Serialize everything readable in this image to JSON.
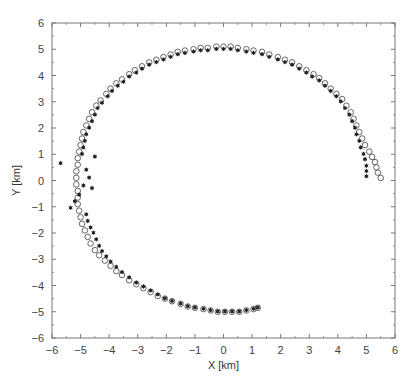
{
  "chart_data": {
    "type": "scatter",
    "title": "",
    "xlabel": "X [km]",
    "ylabel": "Y [km]",
    "xlim": [
      -6,
      6
    ],
    "ylim": [
      -6,
      6
    ],
    "xticks": [
      -6,
      -5,
      -4,
      -3,
      -2,
      -1,
      0,
      1,
      2,
      3,
      4,
      5,
      6
    ],
    "yticks": [
      -6,
      -5,
      -4,
      -3,
      -2,
      -1,
      0,
      1,
      2,
      3,
      4,
      5,
      6
    ],
    "grid": false,
    "legend": null,
    "series": [
      {
        "name": "open-circles",
        "marker": "circle-open",
        "color": "#555555",
        "points": [
          [
            5.5,
            0.1
          ],
          [
            5.4,
            0.3
          ],
          [
            5.35,
            0.5
          ],
          [
            5.3,
            0.7
          ],
          [
            5.2,
            0.9
          ],
          [
            5.1,
            1.1
          ],
          [
            4.95,
            1.35
          ],
          [
            4.85,
            1.6
          ],
          [
            4.75,
            1.85
          ],
          [
            4.65,
            2.1
          ],
          [
            4.55,
            2.35
          ],
          [
            4.45,
            2.6
          ],
          [
            4.3,
            2.85
          ],
          [
            4.15,
            3.1
          ],
          [
            3.95,
            3.3
          ],
          [
            3.75,
            3.5
          ],
          [
            3.55,
            3.7
          ],
          [
            3.35,
            3.9
          ],
          [
            3.15,
            4.05
          ],
          [
            2.9,
            4.2
          ],
          [
            2.65,
            4.35
          ],
          [
            2.4,
            4.5
          ],
          [
            2.15,
            4.6
          ],
          [
            1.9,
            4.7
          ],
          [
            1.6,
            4.8
          ],
          [
            1.35,
            4.9
          ],
          [
            1.05,
            4.95
          ],
          [
            0.8,
            5.0
          ],
          [
            0.5,
            5.05
          ],
          [
            0.25,
            5.1
          ],
          [
            0.0,
            5.1
          ],
          [
            -0.25,
            5.1
          ],
          [
            -0.55,
            5.05
          ],
          [
            -0.8,
            5.05
          ],
          [
            -1.05,
            5.0
          ],
          [
            -1.35,
            4.95
          ],
          [
            -1.6,
            4.9
          ],
          [
            -1.85,
            4.8
          ],
          [
            -2.1,
            4.7
          ],
          [
            -2.35,
            4.6
          ],
          [
            -2.6,
            4.5
          ],
          [
            -2.85,
            4.35
          ],
          [
            -3.1,
            4.2
          ],
          [
            -3.3,
            4.05
          ],
          [
            -3.55,
            3.85
          ],
          [
            -3.75,
            3.7
          ],
          [
            -3.95,
            3.5
          ],
          [
            -4.1,
            3.3
          ],
          [
            -4.3,
            3.05
          ],
          [
            -4.45,
            2.85
          ],
          [
            -4.6,
            2.6
          ],
          [
            -4.7,
            2.35
          ],
          [
            -4.8,
            2.1
          ],
          [
            -4.9,
            1.85
          ],
          [
            -4.95,
            1.6
          ],
          [
            -5.0,
            1.35
          ],
          [
            -5.05,
            1.1
          ],
          [
            -5.1,
            0.85
          ],
          [
            -5.1,
            0.6
          ],
          [
            -5.15,
            0.35
          ],
          [
            -5.15,
            0.1
          ],
          [
            -5.15,
            -0.15
          ],
          [
            -5.1,
            -0.4
          ],
          [
            -5.1,
            -0.65
          ],
          [
            -5.1,
            -0.9
          ],
          [
            -5.05,
            -1.15
          ],
          [
            -5.0,
            -1.4
          ],
          [
            -4.95,
            -1.65
          ],
          [
            -4.85,
            -1.9
          ],
          [
            -4.75,
            -2.15
          ],
          [
            -4.65,
            -2.4
          ],
          [
            -4.5,
            -2.65
          ],
          [
            -4.35,
            -2.85
          ],
          [
            -4.15,
            -3.05
          ],
          [
            -3.95,
            -3.25
          ],
          [
            -3.75,
            -3.45
          ],
          [
            -3.55,
            -3.6
          ],
          [
            -3.3,
            -3.8
          ],
          [
            -3.05,
            -3.95
          ],
          [
            -2.8,
            -4.1
          ],
          [
            -2.55,
            -4.25
          ],
          [
            -2.3,
            -4.4
          ],
          [
            -2.05,
            -4.5
          ],
          [
            -1.8,
            -4.6
          ],
          [
            -1.5,
            -4.7
          ],
          [
            -1.25,
            -4.8
          ],
          [
            -1.0,
            -4.85
          ],
          [
            -0.7,
            -4.9
          ],
          [
            -0.45,
            -4.95
          ],
          [
            -0.2,
            -5.0
          ],
          [
            0.05,
            -5.0
          ],
          [
            0.3,
            -5.0
          ],
          [
            0.55,
            -5.0
          ],
          [
            0.8,
            -4.95
          ],
          [
            1.05,
            -4.9
          ],
          [
            1.2,
            -4.85
          ]
        ]
      },
      {
        "name": "filled-stars",
        "marker": "star-filled",
        "color": "#222222",
        "points": [
          [
            5.0,
            0.2
          ],
          [
            5.0,
            0.4
          ],
          [
            5.0,
            0.6
          ],
          [
            4.95,
            0.85
          ],
          [
            4.9,
            1.05
          ],
          [
            4.8,
            1.3
          ],
          [
            4.75,
            1.55
          ],
          [
            4.65,
            1.8
          ],
          [
            4.6,
            2.05
          ],
          [
            4.5,
            2.3
          ],
          [
            4.4,
            2.55
          ],
          [
            4.25,
            2.8
          ],
          [
            4.1,
            3.05
          ],
          [
            3.95,
            3.25
          ],
          [
            3.75,
            3.45
          ],
          [
            3.55,
            3.65
          ],
          [
            3.35,
            3.85
          ],
          [
            3.1,
            4.0
          ],
          [
            2.9,
            4.15
          ],
          [
            2.65,
            4.3
          ],
          [
            2.4,
            4.45
          ],
          [
            2.15,
            4.55
          ],
          [
            1.9,
            4.65
          ],
          [
            1.6,
            4.75
          ],
          [
            1.35,
            4.85
          ],
          [
            1.05,
            4.9
          ],
          [
            0.8,
            4.95
          ],
          [
            0.5,
            5.0
          ],
          [
            0.25,
            5.05
          ],
          [
            0.0,
            5.05
          ],
          [
            -0.25,
            5.05
          ],
          [
            -0.55,
            5.0
          ],
          [
            -0.8,
            5.0
          ],
          [
            -1.05,
            4.95
          ],
          [
            -1.35,
            4.9
          ],
          [
            -1.6,
            4.85
          ],
          [
            -1.85,
            4.75
          ],
          [
            -2.1,
            4.65
          ],
          [
            -2.35,
            4.55
          ],
          [
            -2.6,
            4.45
          ],
          [
            -2.85,
            4.3
          ],
          [
            -3.05,
            4.15
          ],
          [
            -3.3,
            4.0
          ],
          [
            -3.5,
            3.8
          ],
          [
            -3.7,
            3.65
          ],
          [
            -3.9,
            3.45
          ],
          [
            -4.05,
            3.25
          ],
          [
            -4.25,
            3.0
          ],
          [
            -4.4,
            2.8
          ],
          [
            -4.5,
            2.55
          ],
          [
            -4.6,
            2.3
          ],
          [
            -4.7,
            2.05
          ],
          [
            -4.8,
            1.8
          ],
          [
            -4.85,
            1.55
          ],
          [
            -4.9,
            1.3
          ],
          [
            -4.95,
            1.05
          ],
          [
            -4.5,
            0.95
          ],
          [
            -5.7,
            0.7
          ],
          [
            -4.8,
            0.45
          ],
          [
            -4.7,
            0.15
          ],
          [
            -4.9,
            -0.15
          ],
          [
            -4.6,
            -0.25
          ],
          [
            -5.05,
            -0.5
          ],
          [
            -5.2,
            -0.75
          ],
          [
            -5.35,
            -1.0
          ],
          [
            -4.8,
            -1.25
          ],
          [
            -4.75,
            -1.5
          ],
          [
            -4.65,
            -1.75
          ],
          [
            -4.55,
            -1.95
          ],
          [
            -4.45,
            -2.2
          ],
          [
            -4.35,
            -2.45
          ],
          [
            -4.25,
            -2.65
          ],
          [
            -4.1,
            -2.85
          ],
          [
            -3.95,
            -3.05
          ],
          [
            -3.75,
            -3.25
          ],
          [
            -3.55,
            -3.45
          ],
          [
            -3.3,
            -3.65
          ],
          [
            -3.05,
            -3.85
          ],
          [
            -2.8,
            -4.0
          ],
          [
            -2.55,
            -4.15
          ],
          [
            -2.3,
            -4.3
          ],
          [
            -2.05,
            -4.45
          ],
          [
            -1.8,
            -4.55
          ],
          [
            -1.5,
            -4.65
          ],
          [
            -1.25,
            -4.75
          ],
          [
            -1.0,
            -4.8
          ],
          [
            -0.7,
            -4.85
          ],
          [
            -0.45,
            -4.9
          ],
          [
            -0.2,
            -4.95
          ],
          [
            0.05,
            -4.95
          ],
          [
            0.3,
            -4.95
          ],
          [
            0.55,
            -4.95
          ],
          [
            0.8,
            -4.9
          ],
          [
            1.05,
            -4.85
          ],
          [
            1.2,
            -4.8
          ]
        ]
      }
    ]
  },
  "plot_area": {
    "left": 52,
    "top": 23,
    "right": 395,
    "bottom": 338
  }
}
